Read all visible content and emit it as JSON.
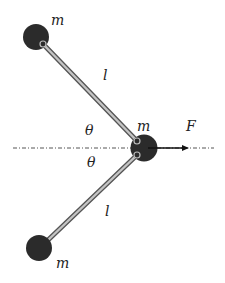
{
  "diagram": {
    "type": "physics-mechanism",
    "masses": [
      {
        "id": "top",
        "label": "m",
        "cx": 36,
        "cy": 37
      },
      {
        "id": "center",
        "label": "m",
        "cx": 144,
        "cy": 148
      },
      {
        "id": "bottom",
        "label": "m",
        "cx": 39,
        "cy": 248
      }
    ],
    "rods": [
      {
        "id": "upper",
        "label": "l"
      },
      {
        "id": "lower",
        "label": "l"
      }
    ],
    "angles": [
      {
        "id": "upper-angle",
        "label": "θ"
      },
      {
        "id": "lower-angle",
        "label": "θ"
      }
    ],
    "force": {
      "label": "F",
      "direction": "right"
    },
    "axis": {
      "style": "dash-dot",
      "orientation": "horizontal"
    },
    "colors": {
      "mass": "#2b2b2b",
      "rod_outer": "#555555",
      "rod_inner": "#bdbdbd",
      "axis": "#555555",
      "arrow": "#111111",
      "text": "#222222"
    }
  }
}
